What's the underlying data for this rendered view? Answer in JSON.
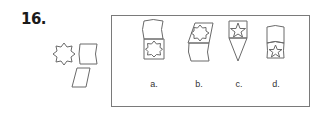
{
  "question": {
    "number": "16."
  },
  "given_pieces": [
    {
      "name": "eight-point-star-polygon"
    },
    {
      "name": "curved-rectangle"
    },
    {
      "name": "parallelogram"
    }
  ],
  "options": [
    {
      "label": "a.",
      "description": "curved rectangle on top of square containing eight-point star"
    },
    {
      "label": "b.",
      "description": "parallelogram containing eight-point star on top of curved rectangle"
    },
    {
      "label": "c.",
      "description": "square with five-point star above downward triangle"
    },
    {
      "label": "d.",
      "description": "curved rectangle on top of curved band containing five-point star"
    }
  ],
  "colors": {
    "stroke": "#6a6a6a",
    "frame": "#7a7a7a",
    "text": "#1a1a1a"
  }
}
